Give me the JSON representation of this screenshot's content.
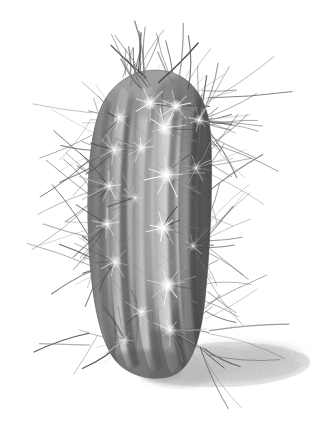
{
  "artwork": {
    "title": "Barrel Cactus",
    "subject": "columnar barrel cactus with radiating spines",
    "medium": "graphite pencil drawing",
    "style": "monochrome botanical illustration",
    "orientation": "portrait",
    "canvas": {
      "width": 327,
      "height": 432
    },
    "background_color": "#ffffff"
  },
  "palette": {
    "background": "#ffffff",
    "body_light": "#d9d9d9",
    "body_mid": "#a8a8a8",
    "body_dark": "#6f6f6f",
    "body_darkest": "#4a4a4a",
    "groove_shadow": "#595959",
    "rib_highlight": "#e8e8e8",
    "spine_dark": "#555555",
    "spine_mid": "#808080",
    "spine_light": "#bdbdbd",
    "areole_white": "#ffffff",
    "ground_shadow": "#c9c9c9",
    "ground_shadow_soft": "#e2e2e2"
  },
  "lighting": {
    "source": "upper-left",
    "highlight_side": "left-of-center",
    "shadow_side": "right"
  },
  "plant": {
    "label": "cactus-body",
    "bounds": {
      "x": 86,
      "y": 70,
      "width": 124,
      "height": 305
    },
    "rib_count": 6,
    "ribs": [
      {
        "name": "rib-far-left",
        "tone": "mid",
        "cx": 100,
        "top_y": 96,
        "bottom_y": 360,
        "half_width": 11
      },
      {
        "name": "rib-left",
        "tone": "mid-light",
        "cx": 122,
        "top_y": 86,
        "bottom_y": 368,
        "half_width": 12
      },
      {
        "name": "rib-center-left",
        "tone": "light",
        "cx": 146,
        "top_y": 80,
        "bottom_y": 372,
        "half_width": 13
      },
      {
        "name": "rib-center",
        "tone": "highlight",
        "cx": 168,
        "top_y": 78,
        "bottom_y": 374,
        "half_width": 14
      },
      {
        "name": "rib-center-right",
        "tone": "dark",
        "cx": 190,
        "top_y": 82,
        "bottom_y": 368,
        "half_width": 12
      },
      {
        "name": "rib-right",
        "tone": "darkest",
        "cx": 205,
        "top_y": 92,
        "bottom_y": 358,
        "half_width": 10
      }
    ],
    "grooves": [
      {
        "name": "groove-1",
        "cx": 111,
        "depth": "medium"
      },
      {
        "name": "groove-2",
        "cx": 134,
        "depth": "deep"
      },
      {
        "name": "groove-3",
        "cx": 157,
        "depth": "medium"
      },
      {
        "name": "groove-4",
        "cx": 179,
        "depth": "deep"
      },
      {
        "name": "groove-5",
        "cx": 198,
        "depth": "deep"
      }
    ],
    "areoles": [
      {
        "x": 150,
        "y": 103,
        "size": 9,
        "brightness": "high"
      },
      {
        "x": 176,
        "y": 106,
        "size": 8,
        "brightness": "high"
      },
      {
        "x": 199,
        "y": 120,
        "size": 7,
        "brightness": "medium"
      },
      {
        "x": 119,
        "y": 118,
        "size": 7,
        "brightness": "medium"
      },
      {
        "x": 165,
        "y": 128,
        "size": 10,
        "brightness": "high"
      },
      {
        "x": 114,
        "y": 150,
        "size": 8,
        "brightness": "medium"
      },
      {
        "x": 141,
        "y": 148,
        "size": 7,
        "brightness": "medium"
      },
      {
        "x": 167,
        "y": 175,
        "size": 11,
        "brightness": "high"
      },
      {
        "x": 196,
        "y": 168,
        "size": 7,
        "brightness": "low"
      },
      {
        "x": 109,
        "y": 186,
        "size": 7,
        "brightness": "medium"
      },
      {
        "x": 135,
        "y": 198,
        "size": 6,
        "brightness": "low"
      },
      {
        "x": 163,
        "y": 228,
        "size": 10,
        "brightness": "high"
      },
      {
        "x": 107,
        "y": 224,
        "size": 8,
        "brightness": "medium"
      },
      {
        "x": 115,
        "y": 262,
        "size": 8,
        "brightness": "medium"
      },
      {
        "x": 168,
        "y": 285,
        "size": 10,
        "brightness": "high"
      },
      {
        "x": 193,
        "y": 246,
        "size": 6,
        "brightness": "low"
      },
      {
        "x": 141,
        "y": 312,
        "size": 7,
        "brightness": "medium"
      },
      {
        "x": 170,
        "y": 330,
        "size": 8,
        "brightness": "medium"
      },
      {
        "x": 125,
        "y": 340,
        "size": 6,
        "brightness": "low"
      }
    ],
    "crown": {
      "label": "cactus-crown",
      "apex_x": 155,
      "apex_y": 74,
      "spine_count": 22,
      "description": "dense upward spray of vertical spines at the apex"
    }
  },
  "spines": {
    "label": "spine-halo",
    "description": "long tapered needles radiating outward from every areole",
    "approximate_count": 210,
    "length_range_px": [
      12,
      78
    ],
    "tone_range": [
      "#4a4a4a",
      "#b5b5b5"
    ]
  },
  "ground_shadow": {
    "label": "cast-shadow",
    "direction": "right and slightly down",
    "bounds": {
      "x": 128,
      "y": 330,
      "width": 186,
      "height": 72
    },
    "texture": "soft graphite stipple",
    "opacity": "light"
  },
  "annotations": {
    "has_text": false,
    "has_border": false,
    "has_signature": false
  }
}
